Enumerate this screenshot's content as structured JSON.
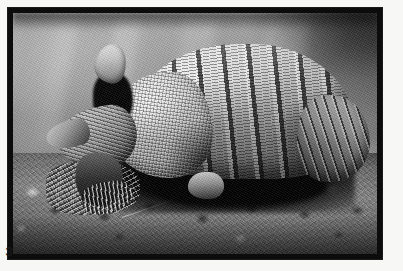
{
  "figure": {
    "caption_number": "3",
    "subject_label": "nine-banded armadillo",
    "photo_style": "black-and-white photograph",
    "frame_color": "#0c0c0c",
    "page_background": "#f7f7f5",
    "caption_color": "#17171a"
  },
  "photo": {
    "background_description": "blurred pale gray bokeh with dark upper-right corner",
    "foreground_description": "rocky clumpy dirt with small twigs",
    "shadow_description": "deep black cast shadow beneath the animal",
    "background_tone": "#9d9d9a",
    "highlight_tone": "#efefec",
    "shadow_tone": "#050505",
    "ground_tone": "#7c7c7a"
  },
  "animal": {
    "parts": [
      {
        "name": "carapace",
        "label": "banded carapace"
      },
      {
        "name": "shoulder-shield",
        "label": "pebbled shoulder shield"
      },
      {
        "name": "hip",
        "label": "rear hip plating"
      },
      {
        "name": "head",
        "label": "head and snout"
      },
      {
        "name": "ear",
        "label": "raised ear"
      },
      {
        "name": "foreleg",
        "label": "foreleg and claws"
      },
      {
        "name": "hindfoot",
        "label": "hind foot"
      }
    ]
  }
}
